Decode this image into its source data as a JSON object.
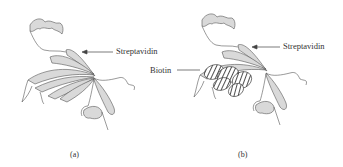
{
  "figure": {
    "panels": [
      {
        "id": "a",
        "caption": "(a)",
        "labels": {
          "streptavidin": "Streptavidin"
        }
      },
      {
        "id": "b",
        "caption": "(b)",
        "labels": {
          "streptavidin": "Streptavidin",
          "biotin": "Biotin"
        }
      }
    ],
    "colors": {
      "ribbon_fill": "#d9d9d9",
      "outline": "#555555",
      "background": "#ffffff"
    }
  }
}
